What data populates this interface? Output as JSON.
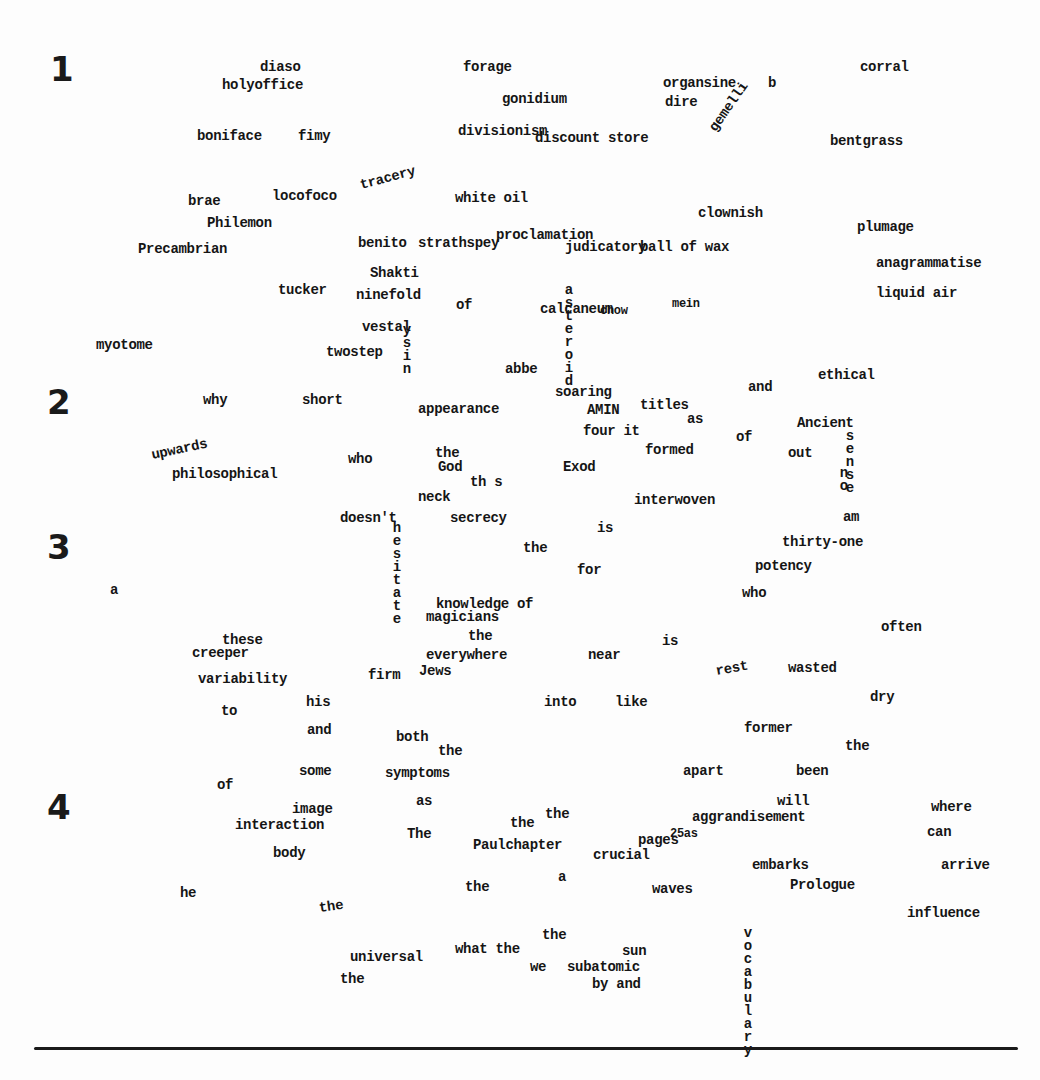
{
  "numerals": [
    {
      "label": "1",
      "x": 50,
      "y": 52
    },
    {
      "label": "2",
      "x": 47,
      "y": 385
    },
    {
      "label": "3",
      "x": 47,
      "y": 530
    },
    {
      "label": "4",
      "x": 47,
      "y": 790
    }
  ],
  "words": [
    {
      "text": "diaso",
      "x": 260,
      "y": 60
    },
    {
      "text": "holyoffice",
      "x": 222,
      "y": 78
    },
    {
      "text": "forage",
      "x": 463,
      "y": 60
    },
    {
      "text": "gonidium",
      "x": 502,
      "y": 92
    },
    {
      "text": "organsine",
      "x": 663,
      "y": 76
    },
    {
      "text": "dire",
      "x": 665,
      "y": 95
    },
    {
      "text": "corral",
      "x": 860,
      "y": 60
    },
    {
      "text": "boniface",
      "x": 197,
      "y": 129
    },
    {
      "text": "fimy",
      "x": 298,
      "y": 129
    },
    {
      "text": "divisionism",
      "x": 458,
      "y": 124
    },
    {
      "text": "discount store",
      "x": 535,
      "y": 131
    },
    {
      "text": "bentgrass",
      "x": 830,
      "y": 134
    },
    {
      "text": "brae",
      "x": 188,
      "y": 194
    },
    {
      "text": "locofoco",
      "x": 272,
      "y": 189
    },
    {
      "text": "tracery",
      "x": 362,
      "y": 178,
      "rotate": -15
    },
    {
      "text": "white oil",
      "x": 455,
      "y": 191
    },
    {
      "text": "Philemon",
      "x": 207,
      "y": 216
    },
    {
      "text": "clownish",
      "x": 698,
      "y": 206
    },
    {
      "text": "plumage",
      "x": 857,
      "y": 220
    },
    {
      "text": "Precambrian",
      "x": 138,
      "y": 242
    },
    {
      "text": "benito",
      "x": 358,
      "y": 236
    },
    {
      "text": "strathspey",
      "x": 418,
      "y": 236
    },
    {
      "text": "proclamation",
      "x": 496,
      "y": 228
    },
    {
      "text": "judicatory",
      "x": 565,
      "y": 240
    },
    {
      "text": "ball of wax",
      "x": 640,
      "y": 240
    },
    {
      "text": "anagrammatise",
      "x": 876,
      "y": 256
    },
    {
      "text": "Shakti",
      "x": 370,
      "y": 266
    },
    {
      "text": "tucker",
      "x": 278,
      "y": 283
    },
    {
      "text": "ninefold",
      "x": 356,
      "y": 288
    },
    {
      "text": "of",
      "x": 456,
      "y": 298
    },
    {
      "text": "calcaneum",
      "x": 540,
      "y": 302
    },
    {
      "text": "chow",
      "x": 600,
      "y": 305,
      "small": true
    },
    {
      "text": "mein",
      "x": 672,
      "y": 298,
      "small": true
    },
    {
      "text": "liquid air",
      "x": 876,
      "y": 286
    },
    {
      "text": "vestal",
      "x": 362,
      "y": 320
    },
    {
      "text": "myotome",
      "x": 96,
      "y": 338
    },
    {
      "text": "twostep",
      "x": 326,
      "y": 345
    },
    {
      "text": "abbe",
      "x": 505,
      "y": 362
    },
    {
      "text": "ethical",
      "x": 818,
      "y": 368
    },
    {
      "text": "and",
      "x": 748,
      "y": 380
    },
    {
      "text": "why",
      "x": 203,
      "y": 393
    },
    {
      "text": "short",
      "x": 302,
      "y": 393
    },
    {
      "text": "appearance",
      "x": 418,
      "y": 402
    },
    {
      "text": "soaring",
      "x": 555,
      "y": 385
    },
    {
      "text": "AMIN",
      "x": 587,
      "y": 403
    },
    {
      "text": "titles",
      "x": 640,
      "y": 398
    },
    {
      "text": "as",
      "x": 687,
      "y": 412
    },
    {
      "text": "Ancient",
      "x": 797,
      "y": 416
    },
    {
      "text": "four it",
      "x": 583,
      "y": 424
    },
    {
      "text": "of",
      "x": 736,
      "y": 430
    },
    {
      "text": "formed",
      "x": 645,
      "y": 443
    },
    {
      "text": "out",
      "x": 788,
      "y": 446
    },
    {
      "text": "upwards",
      "x": 153,
      "y": 448,
      "rotate": -12
    },
    {
      "text": "philosophical",
      "x": 172,
      "y": 467
    },
    {
      "text": "who",
      "x": 348,
      "y": 452
    },
    {
      "text": "the",
      "x": 435,
      "y": 446
    },
    {
      "text": "God",
      "x": 438,
      "y": 460
    },
    {
      "text": "th s",
      "x": 470,
      "y": 475
    },
    {
      "text": "Exod",
      "x": 563,
      "y": 460
    },
    {
      "text": "neck",
      "x": 418,
      "y": 490
    },
    {
      "text": "interwoven",
      "x": 634,
      "y": 493
    },
    {
      "text": "doesn't",
      "x": 340,
      "y": 511
    },
    {
      "text": "secrecy",
      "x": 450,
      "y": 511
    },
    {
      "text": "am",
      "x": 843,
      "y": 510
    },
    {
      "text": "is",
      "x": 597,
      "y": 521
    },
    {
      "text": "thirty-one",
      "x": 782,
      "y": 535
    },
    {
      "text": "the",
      "x": 523,
      "y": 541
    },
    {
      "text": "for",
      "x": 577,
      "y": 563
    },
    {
      "text": "potency",
      "x": 755,
      "y": 559
    },
    {
      "text": "a",
      "x": 110,
      "y": 583
    },
    {
      "text": "who",
      "x": 742,
      "y": 586
    },
    {
      "text": "knowledge of",
      "x": 436,
      "y": 597
    },
    {
      "text": "magicians",
      "x": 426,
      "y": 610
    },
    {
      "text": "often",
      "x": 881,
      "y": 620
    },
    {
      "text": "these",
      "x": 222,
      "y": 633
    },
    {
      "text": "creeper",
      "x": 192,
      "y": 646
    },
    {
      "text": "the",
      "x": 468,
      "y": 629
    },
    {
      "text": "is",
      "x": 662,
      "y": 634
    },
    {
      "text": "everywhere",
      "x": 426,
      "y": 648
    },
    {
      "text": "near",
      "x": 588,
      "y": 648
    },
    {
      "text": "firm",
      "x": 368,
      "y": 668
    },
    {
      "text": "Jews",
      "x": 419,
      "y": 664
    },
    {
      "text": "rest",
      "x": 717,
      "y": 664,
      "rotate": -10
    },
    {
      "text": "wasted",
      "x": 788,
      "y": 661
    },
    {
      "text": "variability",
      "x": 198,
      "y": 672
    },
    {
      "text": "dry",
      "x": 870,
      "y": 690
    },
    {
      "text": "to",
      "x": 221,
      "y": 704
    },
    {
      "text": "his",
      "x": 306,
      "y": 695
    },
    {
      "text": "into",
      "x": 544,
      "y": 695
    },
    {
      "text": "like",
      "x": 615,
      "y": 695
    },
    {
      "text": "former",
      "x": 744,
      "y": 721
    },
    {
      "text": "and",
      "x": 307,
      "y": 723
    },
    {
      "text": "both",
      "x": 396,
      "y": 730
    },
    {
      "text": "the",
      "x": 438,
      "y": 744
    },
    {
      "text": "the",
      "x": 845,
      "y": 739
    },
    {
      "text": "some",
      "x": 299,
      "y": 764
    },
    {
      "text": "symptoms",
      "x": 385,
      "y": 766
    },
    {
      "text": "apart",
      "x": 683,
      "y": 764
    },
    {
      "text": "been",
      "x": 796,
      "y": 764
    },
    {
      "text": "of",
      "x": 217,
      "y": 778
    },
    {
      "text": "as",
      "x": 416,
      "y": 794
    },
    {
      "text": "image",
      "x": 292,
      "y": 802
    },
    {
      "text": "will",
      "x": 777,
      "y": 794
    },
    {
      "text": "where",
      "x": 931,
      "y": 800
    },
    {
      "text": "the",
      "x": 545,
      "y": 807
    },
    {
      "text": "the",
      "x": 510,
      "y": 816
    },
    {
      "text": "interaction",
      "x": 235,
      "y": 818
    },
    {
      "text": "aggrandisement",
      "x": 692,
      "y": 810
    },
    {
      "text": "The",
      "x": 407,
      "y": 827
    },
    {
      "text": "pages",
      "x": 638,
      "y": 833
    },
    {
      "text": "25as",
      "x": 670,
      "y": 828,
      "small": true
    },
    {
      "text": "can",
      "x": 927,
      "y": 825
    },
    {
      "text": "Paulchapter",
      "x": 473,
      "y": 838
    },
    {
      "text": "crucial",
      "x": 593,
      "y": 848
    },
    {
      "text": "body",
      "x": 273,
      "y": 846
    },
    {
      "text": "embarks",
      "x": 752,
      "y": 858
    },
    {
      "text": "arrive",
      "x": 941,
      "y": 858
    },
    {
      "text": "a",
      "x": 558,
      "y": 870
    },
    {
      "text": "Prologue",
      "x": 790,
      "y": 878
    },
    {
      "text": "he",
      "x": 180,
      "y": 886
    },
    {
      "text": "the",
      "x": 465,
      "y": 880
    },
    {
      "text": "waves",
      "x": 652,
      "y": 882
    },
    {
      "text": "the",
      "x": 320,
      "y": 901,
      "rotate": -8
    },
    {
      "text": "influence",
      "x": 907,
      "y": 906
    },
    {
      "text": "the",
      "x": 542,
      "y": 928
    },
    {
      "text": "universal",
      "x": 350,
      "y": 950
    },
    {
      "text": "what the",
      "x": 455,
      "y": 942
    },
    {
      "text": "sun",
      "x": 622,
      "y": 944
    },
    {
      "text": "we",
      "x": 530,
      "y": 960
    },
    {
      "text": "subatomic",
      "x": 567,
      "y": 960
    },
    {
      "text": "the",
      "x": 340,
      "y": 972
    },
    {
      "text": "by and",
      "x": 592,
      "y": 977
    }
  ],
  "vertical_words": [
    {
      "text": "vocabulary",
      "x": 741,
      "y": 925
    },
    {
      "text": "hesitate",
      "x": 390,
      "y": 520
    },
    {
      "text": "ysin",
      "x": 400,
      "y": 322
    },
    {
      "text": "asteroid",
      "x": 562,
      "y": 282
    },
    {
      "text": "sense",
      "x": 843,
      "y": 428
    },
    {
      "text": "no",
      "x": 837,
      "y": 465
    }
  ],
  "diagonal_words": [
    {
      "text": "gemelli",
      "x": 718,
      "y": 120,
      "rotate": -55
    },
    {
      "text": "b",
      "x": 768,
      "y": 76,
      "rotate": 0
    }
  ],
  "bottom_rule": true,
  "colors": {
    "ink": "#151515",
    "paper": "#fdfdfd"
  }
}
